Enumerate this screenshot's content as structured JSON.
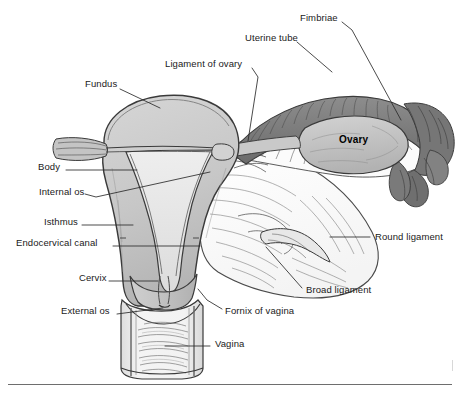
{
  "figure": {
    "width": 460,
    "height": 399,
    "background": "#ffffff"
  },
  "palette": {
    "line": "#3a3a3a",
    "leader": "#2b2b2b",
    "text": "#1a1a1a",
    "uterus_fill": "#c9c9c9",
    "uterus_fill_dark": "#b3b3b3",
    "cavity_fill": "#e4e4e4",
    "tube_dark": "#7d7d7d",
    "tube_darker": "#686868",
    "ovary_fill": "#c2c2c2",
    "ligament_fill": "#fafafa",
    "vagina_fill": "#efefef",
    "rule": "#6e6e6e"
  },
  "labels": [
    {
      "id": "fundus",
      "text": "Fundus",
      "x": 85,
      "y": 84,
      "align": "left"
    },
    {
      "id": "ligament-of-ovary",
      "text": "Ligament of ovary",
      "x": 165,
      "y": 64,
      "align": "left"
    },
    {
      "id": "uterine-tube",
      "text": "Uterine tube",
      "x": 245,
      "y": 38,
      "align": "left"
    },
    {
      "id": "fimbriae",
      "text": "Fimbriae",
      "x": 300,
      "y": 18,
      "align": "left"
    },
    {
      "id": "body",
      "text": "Body",
      "x": 38,
      "y": 167,
      "align": "left"
    },
    {
      "id": "internal-os",
      "text": "Internal os",
      "x": 39,
      "y": 192,
      "align": "left"
    },
    {
      "id": "isthmus",
      "text": "Isthmus",
      "x": 44,
      "y": 222,
      "align": "left"
    },
    {
      "id": "endocervical-canal",
      "text": "Endocervical canal",
      "x": 16,
      "y": 243,
      "align": "left"
    },
    {
      "id": "cervix",
      "text": "Cervix",
      "x": 79,
      "y": 278,
      "align": "left"
    },
    {
      "id": "external-os",
      "text": "External os",
      "x": 61,
      "y": 311,
      "align": "left"
    },
    {
      "id": "ovary",
      "text": "Ovary",
      "x": 339,
      "y": 140,
      "align": "left",
      "style": "ovary-tag"
    },
    {
      "id": "round-ligament",
      "text": "Round ligament",
      "x": 375,
      "y": 237,
      "align": "left"
    },
    {
      "id": "broad-ligament",
      "text": "Broad ligament",
      "x": 306,
      "y": 290,
      "align": "left"
    },
    {
      "id": "fornix-of-vagina",
      "text": "Fornix of vagina",
      "x": 225,
      "y": 311,
      "align": "left"
    },
    {
      "id": "vagina",
      "text": "Vagina",
      "x": 215,
      "y": 344,
      "align": "left"
    }
  ],
  "leaders": [
    {
      "id": "fundus",
      "points": "120,89 160,108"
    },
    {
      "id": "ligament-of-ovary",
      "points": "252,68 258,77 247,140"
    },
    {
      "id": "uterine-tube",
      "points": "297,42 332,72"
    },
    {
      "id": "fimbriae",
      "points": "342,22 352,30 401,120"
    },
    {
      "id": "body",
      "points": "66,170 137,170"
    },
    {
      "id": "internal-os",
      "points": "85,194 96,197 210,172"
    },
    {
      "id": "isthmus",
      "points": "82,225 133,225"
    },
    {
      "id": "endocervical-canal",
      "points": "113,246 200,246"
    },
    {
      "id": "cervix",
      "points": "109,281 158,281"
    },
    {
      "id": "external-os",
      "points": "117,314 163,308"
    },
    {
      "id": "round-ligament",
      "points": "370,237 330,237"
    },
    {
      "id": "broad-ligament",
      "points": "302,288 266,247"
    },
    {
      "id": "fornix-of-vagina",
      "points": "222,309 207,300 198,289"
    },
    {
      "id": "vagina",
      "points": "210,346 165,346"
    }
  ],
  "structures": [
    {
      "id": "uterine-fundus",
      "name": "Fundus of uterus"
    },
    {
      "id": "uterine-body",
      "name": "Body of uterus"
    },
    {
      "id": "endometrial-cavity",
      "name": "Endometrial cavity"
    },
    {
      "id": "cervix",
      "name": "Cervix"
    },
    {
      "id": "vagina",
      "name": "Vagina"
    },
    {
      "id": "uterine-tube",
      "name": "Uterine tube"
    },
    {
      "id": "fimbriae",
      "name": "Fimbriae"
    },
    {
      "id": "ovary",
      "name": "Ovary"
    },
    {
      "id": "broad-ligament",
      "name": "Broad ligament"
    },
    {
      "id": "round-ligament",
      "name": "Round ligament"
    },
    {
      "id": "ligament-of-ovary",
      "name": "Ligament of ovary"
    }
  ]
}
